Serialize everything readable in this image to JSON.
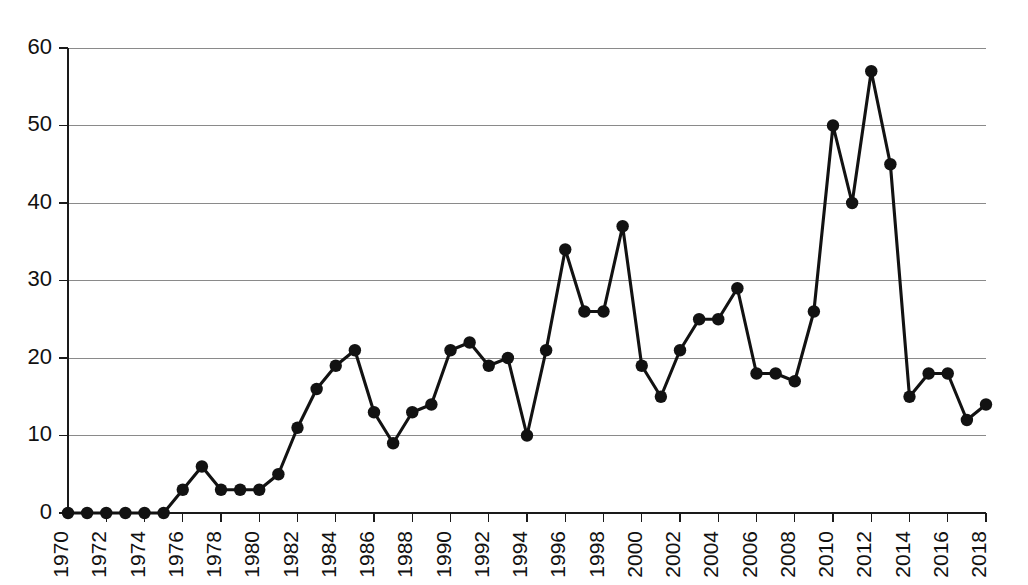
{
  "chart_data": {
    "type": "line",
    "title": "",
    "subtitle": "",
    "xlabel": "",
    "ylabel": "",
    "xlim": [
      1970,
      2018
    ],
    "ylim": [
      0,
      60
    ],
    "grid": true,
    "legend": false,
    "legend_position": "none",
    "marker": "filled-circle",
    "line_color": "#121212",
    "grid_color": "#8a8a8a",
    "axis_color": "#1a1a1a",
    "background_color": "#ffffff",
    "x_tick_labels": [
      "1970",
      "1972",
      "1974",
      "1976",
      "1978",
      "1980",
      "1982",
      "1984",
      "1986",
      "1988",
      "1990",
      "1992",
      "1994",
      "1996",
      "1998",
      "2000",
      "2002",
      "2004",
      "2006",
      "2008",
      "2010",
      "2012",
      "2014",
      "2016",
      "2018"
    ],
    "x_tick_values": [
      1970,
      1972,
      1974,
      1976,
      1978,
      1980,
      1982,
      1984,
      1986,
      1988,
      1990,
      1992,
      1994,
      1996,
      1998,
      2000,
      2002,
      2004,
      2006,
      2008,
      2010,
      2012,
      2014,
      2016,
      2018
    ],
    "x_tick_rotation": 90,
    "y_tick_labels": [
      "0",
      "10",
      "20",
      "30",
      "40",
      "50",
      "60"
    ],
    "y_tick_values": [
      0,
      10,
      20,
      30,
      40,
      50,
      60
    ],
    "x": [
      1970,
      1971,
      1972,
      1973,
      1974,
      1975,
      1976,
      1977,
      1978,
      1979,
      1980,
      1981,
      1982,
      1983,
      1984,
      1985,
      1986,
      1987,
      1988,
      1989,
      1990,
      1991,
      1992,
      1993,
      1994,
      1995,
      1996,
      1997,
      1998,
      1999,
      2000,
      2001,
      2002,
      2003,
      2004,
      2005,
      2006,
      2007,
      2008,
      2009,
      2010,
      2011,
      2012,
      2013,
      2014,
      2015,
      2016,
      2017,
      2018
    ],
    "values": [
      0,
      0,
      0,
      0,
      0,
      0,
      3,
      6,
      3,
      3,
      3,
      5,
      11,
      16,
      19,
      21,
      13,
      9,
      13,
      14,
      21,
      22,
      19,
      20,
      10,
      21,
      34,
      26,
      26,
      37,
      19,
      15,
      21,
      25,
      25,
      29,
      18,
      18,
      17,
      26,
      50,
      40,
      57,
      45,
      15,
      18,
      18,
      12,
      14
    ],
    "series": [
      {
        "name": "series-1",
        "values": [
          0,
          0,
          0,
          0,
          0,
          0,
          3,
          6,
          3,
          3,
          3,
          5,
          11,
          16,
          19,
          21,
          13,
          9,
          13,
          14,
          21,
          22,
          19,
          20,
          10,
          21,
          34,
          26,
          26,
          37,
          19,
          15,
          21,
          25,
          25,
          29,
          18,
          18,
          17,
          26,
          50,
          40,
          57,
          45,
          15,
          18,
          18,
          12,
          14
        ]
      }
    ]
  }
}
